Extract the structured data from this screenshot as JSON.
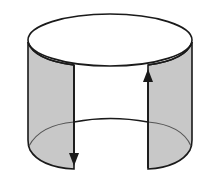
{
  "diagram": {
    "colors": {
      "background": "#ffffff",
      "stroke": "#1a1a1a",
      "strip_fill": "#c8c8c8",
      "inner_line": "#555555"
    },
    "elements": [
      {
        "name": "top-ellipse",
        "label": ""
      },
      {
        "name": "left-strip",
        "label": "",
        "arrow": "down"
      },
      {
        "name": "right-strip",
        "label": "",
        "arrow": "up"
      },
      {
        "name": "bottom-back-arc",
        "label": ""
      }
    ]
  }
}
